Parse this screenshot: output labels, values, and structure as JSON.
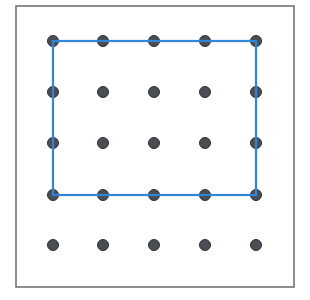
{
  "geoboard": {
    "frame": {
      "x": 16,
      "y": 6,
      "w": 278,
      "h": 281,
      "stroke": "#6a6a6a"
    },
    "grid": {
      "cols": [
        53,
        103,
        154,
        205,
        256
      ],
      "rows": [
        41,
        92,
        143,
        195,
        245
      ],
      "dot_radius": 5.5,
      "dot_color": "#4a4d52"
    },
    "rectangle": {
      "from": {
        "col": 0,
        "row": 0
      },
      "to": {
        "col": 4,
        "row": 3
      },
      "stroke": "#2f86d6",
      "width_units": 4,
      "height_units": 3
    }
  }
}
